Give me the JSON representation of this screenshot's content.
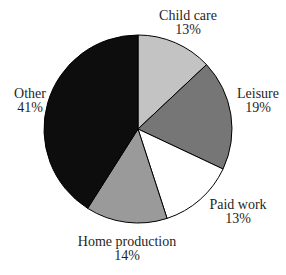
{
  "figure": {
    "background": "#ffffff"
  },
  "chart_data": {
    "type": "pie",
    "title": "",
    "categories": [
      "Child care",
      "Leisure",
      "Paid work",
      "Home production",
      "Other"
    ],
    "values": [
      13,
      19,
      13,
      14,
      41
    ],
    "unit": "%",
    "start_angle_deg": 0,
    "direction": "clockwise",
    "legend_position": "none",
    "labels_position": "outside",
    "outline_color": "#000000",
    "text_color": "#1f1f1f",
    "geometry": {
      "cx": 138,
      "cy": 129,
      "r": 94
    },
    "slices": [
      {
        "label": "Child care",
        "pct_label": "13%",
        "value": 13,
        "color": "#c3c3c3",
        "label_x": 188,
        "label_y": 9
      },
      {
        "label": "Leisure",
        "pct_label": "19%",
        "value": 19,
        "color": "#767676",
        "label_x": 258,
        "label_y": 87
      },
      {
        "label": "Paid work",
        "pct_label": "13%",
        "value": 13,
        "color": "#ffffff",
        "label_x": 238,
        "label_y": 198
      },
      {
        "label": "Home production",
        "pct_label": "14%",
        "value": 14,
        "color": "#9a9a9a",
        "label_x": 127,
        "label_y": 235
      },
      {
        "label": "Other",
        "pct_label": "41%",
        "value": 41,
        "color": "#0d0d0d",
        "label_x": 30,
        "label_y": 87
      }
    ]
  }
}
